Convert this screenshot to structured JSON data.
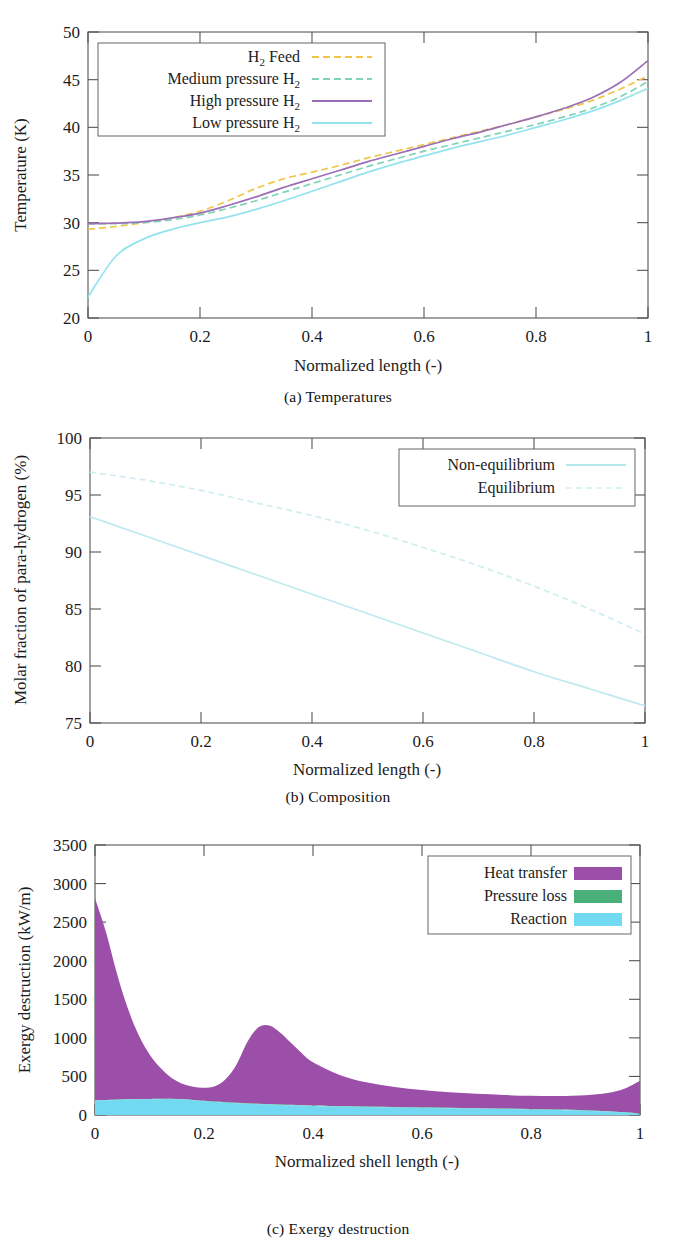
{
  "figure": {
    "subfigures": [
      {
        "caption": "(a) Temperatures"
      },
      {
        "caption": "(b) Composition"
      },
      {
        "caption": "(c) Exergy destruction"
      }
    ]
  },
  "colors": {
    "h2_feed": "#f0c64a",
    "medium_pressure": "#7fd4b8",
    "high_pressure": "#9b6fb5",
    "low_pressure": "#93e3ee",
    "heat_transfer": "#9b4fa8",
    "pressure_loss": "#49b07a",
    "reaction": "#72d9f2",
    "equilibrium": "#cfeef0",
    "non_equilibrium": "#bfeaef",
    "axis": "#555555",
    "text": "#1c1c1c"
  },
  "chart_data": [
    {
      "type": "line",
      "id": "temperatures",
      "title": "(a) Temperatures",
      "xlabel": "Normalized length (-)",
      "ylabel": "Temperature (K)",
      "xlim": [
        0,
        1
      ],
      "ylim": [
        20,
        50
      ],
      "xticks": [
        0,
        0.2,
        0.4,
        0.6,
        0.8,
        1
      ],
      "xticklabels": [
        "0",
        "0.2",
        "0.4",
        "0.6",
        "0.8",
        "1"
      ],
      "yticks": [
        20,
        25,
        30,
        35,
        40,
        45,
        50
      ],
      "yticklabels": [
        "20",
        "25",
        "30",
        "35",
        "40",
        "45",
        "50"
      ],
      "grid": false,
      "legend_position": "upper-left",
      "x": [
        0,
        0.05,
        0.1,
        0.15,
        0.2,
        0.25,
        0.3,
        0.35,
        0.4,
        0.45,
        0.5,
        0.55,
        0.6,
        0.65,
        0.7,
        0.75,
        0.8,
        0.85,
        0.9,
        0.95,
        1
      ],
      "series": [
        {
          "name": "H_2 Feed",
          "label": "H2 Feed",
          "color": "#f0c64a",
          "style": "dashed",
          "values": [
            29.3,
            29.6,
            30.0,
            30.5,
            31.2,
            32.3,
            33.6,
            34.6,
            35.3,
            36.0,
            36.8,
            37.5,
            38.2,
            38.9,
            39.6,
            40.3,
            41.1,
            41.9,
            42.8,
            44.0,
            45.4
          ]
        },
        {
          "name": "Medium pressure H_2",
          "label": "Medium pressure H2",
          "color": "#7fd4b8",
          "style": "dashed",
          "values": [
            29.9,
            29.9,
            30.0,
            30.3,
            30.8,
            31.5,
            32.3,
            33.2,
            34.1,
            35.0,
            35.9,
            36.7,
            37.5,
            38.2,
            38.9,
            39.6,
            40.3,
            41.1,
            42.0,
            43.2,
            44.8
          ]
        },
        {
          "name": "High pressure H_2",
          "label": "High pressure H2",
          "color": "#9b6fb5",
          "style": "solid",
          "values": [
            29.9,
            29.95,
            30.1,
            30.5,
            31.0,
            31.8,
            32.7,
            33.7,
            34.6,
            35.5,
            36.4,
            37.2,
            38.0,
            38.8,
            39.5,
            40.3,
            41.1,
            42.0,
            43.1,
            44.7,
            47.0
          ]
        },
        {
          "name": "Low pressure H_2",
          "label": "Low pressure H2",
          "color": "#93e3ee",
          "style": "solid",
          "values": [
            22.2,
            26.5,
            28.3,
            29.3,
            30.0,
            30.6,
            31.4,
            32.3,
            33.3,
            34.3,
            35.3,
            36.2,
            37.0,
            37.8,
            38.5,
            39.2,
            40.0,
            40.8,
            41.7,
            42.8,
            44.1
          ]
        }
      ]
    },
    {
      "type": "line",
      "id": "composition",
      "title": "(b) Composition",
      "xlabel": "Normalized length (-)",
      "ylabel": "Molar fraction of para-hydrogen (%)",
      "xlim": [
        0,
        1
      ],
      "ylim": [
        75,
        100
      ],
      "xticks": [
        0,
        0.2,
        0.4,
        0.6,
        0.8,
        1
      ],
      "xticklabels": [
        "0",
        "0.2",
        "0.4",
        "0.6",
        "0.8",
        "1"
      ],
      "yticks": [
        75,
        80,
        85,
        90,
        95,
        100
      ],
      "yticklabels": [
        "75",
        "80",
        "85",
        "90",
        "95",
        "100"
      ],
      "grid": false,
      "legend_position": "upper-right",
      "x": [
        0,
        0.1,
        0.2,
        0.3,
        0.4,
        0.5,
        0.6,
        0.7,
        0.8,
        0.9,
        1
      ],
      "series": [
        {
          "name": "Non-equilibrium",
          "label": "Non-equilibrium",
          "color": "#bfeaef",
          "style": "solid",
          "values": [
            93.1,
            91.4,
            89.7,
            88.0,
            86.3,
            84.6,
            82.9,
            81.2,
            79.5,
            78.0,
            76.5
          ]
        },
        {
          "name": "Equilibrium",
          "label": "Equilibrium",
          "color": "#cfeef0",
          "style": "dashed",
          "values": [
            97.0,
            96.3,
            95.4,
            94.3,
            93.2,
            91.9,
            90.4,
            88.8,
            87.0,
            85.0,
            82.8
          ]
        }
      ]
    },
    {
      "type": "area",
      "id": "exergy-destruction",
      "title": "(c) Exergy destruction",
      "xlabel": "Normalized shell length (-)",
      "ylabel": "Exergy destruction (kW/m)",
      "xlim": [
        0,
        1
      ],
      "ylim": [
        0,
        3500
      ],
      "xticks": [
        0,
        0.2,
        0.4,
        0.6,
        0.8,
        1
      ],
      "xticklabels": [
        "0",
        "0.2",
        "0.4",
        "0.6",
        "0.8",
        "1"
      ],
      "yticks": [
        0,
        500,
        1000,
        1500,
        2000,
        2500,
        3000,
        3500
      ],
      "yticklabels": [
        "0",
        "500",
        "1000",
        "1500",
        "2000",
        "2500",
        "3000",
        "3500"
      ],
      "grid": false,
      "stacked": true,
      "legend_position": "upper-right",
      "x": [
        0,
        0.02,
        0.04,
        0.06,
        0.08,
        0.1,
        0.12,
        0.14,
        0.16,
        0.18,
        0.2,
        0.22,
        0.24,
        0.26,
        0.28,
        0.3,
        0.32,
        0.34,
        0.36,
        0.38,
        0.4,
        0.45,
        0.5,
        0.55,
        0.6,
        0.65,
        0.7,
        0.75,
        0.8,
        0.85,
        0.9,
        0.94,
        0.97,
        0.99,
        1
      ],
      "series": [
        {
          "name": "Reaction",
          "label": "Reaction",
          "color": "#72d9f2",
          "values": [
            185,
            190,
            196,
            200,
            202,
            203,
            205,
            206,
            200,
            190,
            178,
            168,
            160,
            152,
            146,
            140,
            135,
            130,
            126,
            122,
            118,
            110,
            104,
            98,
            93,
            88,
            83,
            78,
            72,
            65,
            55,
            44,
            32,
            20,
            8
          ]
        },
        {
          "name": "Pressure loss",
          "label": "Pressure loss",
          "color": "#49b07a",
          "values": [
            6,
            6,
            6,
            6,
            6,
            6,
            6,
            6,
            6,
            6,
            6,
            6,
            6,
            6,
            6,
            6,
            6,
            6,
            6,
            6,
            6,
            6,
            6,
            6,
            6,
            6,
            6,
            6,
            6,
            6,
            6,
            6,
            6,
            6,
            6
          ]
        },
        {
          "name": "Heat transfer",
          "label": "Heat transfer",
          "color": "#9b4fa8",
          "values": [
            2620,
            2180,
            1640,
            1180,
            830,
            580,
            400,
            270,
            200,
            170,
            170,
            200,
            300,
            500,
            800,
            990,
            1020,
            930,
            800,
            670,
            560,
            400,
            310,
            260,
            225,
            200,
            185,
            175,
            170,
            175,
            195,
            235,
            300,
            380,
            430
          ]
        }
      ]
    }
  ]
}
